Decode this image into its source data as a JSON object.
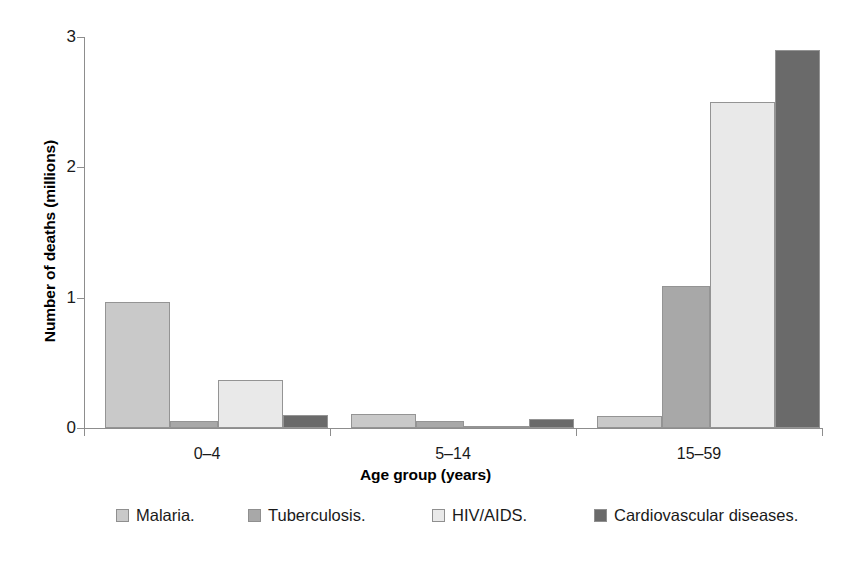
{
  "chart_data": {
    "type": "bar",
    "title": "",
    "subtitle": "",
    "xlabel": "Age group (years)",
    "ylabel": "Number of deaths (millions)",
    "categories": [
      "0–4",
      "5–14",
      "15–59"
    ],
    "ylim": [
      0,
      3
    ],
    "yticks": [
      "0",
      "1",
      "2",
      "3"
    ],
    "ytick_values": [
      0,
      1,
      2,
      3
    ],
    "grid": false,
    "legend_position": "bottom",
    "series": [
      {
        "name": "Malaria.",
        "color": "#c9c9c9",
        "values": [
          0.97,
          0.11,
          0.09
        ]
      },
      {
        "name": "Tuberculosis.",
        "color": "#a8a8a8",
        "values": [
          0.05,
          0.05,
          1.09
        ]
      },
      {
        "name": "HIV/AIDS.",
        "color": "#e9e9e9",
        "values": [
          0.37,
          0.015,
          2.5
        ]
      },
      {
        "name": "Cardiovascular diseases.",
        "color": "#6a6a6a",
        "values": [
          0.1,
          0.07,
          2.9
        ]
      }
    ]
  },
  "axes": {
    "y_title": "Number of deaths (millions)",
    "x_title": "Age group (years)",
    "y_tick_labels": [
      "3",
      "2",
      "1",
      "0"
    ],
    "x_group_labels": [
      "0–4",
      "5–14",
      "15–59"
    ]
  },
  "legend": {
    "entries": [
      {
        "label": "Malaria.",
        "color": "#c9c9c9"
      },
      {
        "label": "Tuberculosis.",
        "color": "#a8a8a8"
      },
      {
        "label": "HIV/AIDS.",
        "color": "#e9e9e9"
      },
      {
        "label": "Cardiovascular diseases.",
        "color": "#6a6a6a"
      }
    ]
  }
}
